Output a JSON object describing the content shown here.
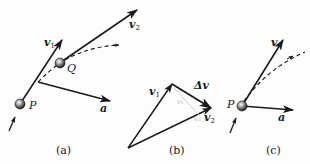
{
  "figure": {
    "panels": [
      {
        "id": "a",
        "caption": "(a)",
        "points": [
          {
            "label": "P"
          },
          {
            "label": "Q"
          }
        ],
        "vectors": [
          {
            "label": "v",
            "subscript": "1"
          },
          {
            "label": "v",
            "subscript": "2"
          },
          {
            "label": "a"
          }
        ],
        "path": "dashed trajectory curve"
      },
      {
        "id": "b",
        "caption": "(b)",
        "vectors": [
          {
            "label": "v",
            "subscript": "1"
          },
          {
            "label": "v",
            "subscript": "2"
          },
          {
            "label": "Δv"
          }
        ],
        "faint_labels": [
          "v₁",
          "v₂"
        ]
      },
      {
        "id": "c",
        "caption": "(c)",
        "points": [
          {
            "label": "P"
          }
        ],
        "vectors": [
          {
            "label": "v"
          },
          {
            "label": "a"
          }
        ],
        "path": "dashed trajectory curve"
      }
    ],
    "colors": {
      "ink": "#1a1a1a",
      "faint": "#bdbdbd",
      "background": "#fdfdfd"
    }
  }
}
